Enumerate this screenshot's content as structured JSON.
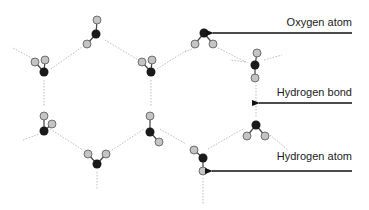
{
  "colors": {
    "oxygen": "#1a1a1a",
    "hydrogen": "#c4c4c4",
    "hydrogen_stroke": "#555555",
    "covalent_bond": "#444444",
    "hydrogen_bond": "#bdbdbd",
    "arrow": "#111111"
  },
  "labels": [
    {
      "id": "oxygen-atom",
      "text": "Oxygen atom",
      "x": 352,
      "y": 27,
      "arrow_from": [
        352,
        33
      ],
      "arrow_to": [
        213,
        33
      ]
    },
    {
      "id": "hydrogen-bond",
      "text": "Hydrogen bond",
      "x": 352,
      "y": 96,
      "arrow_from": [
        352,
        103
      ],
      "arrow_to": [
        259,
        103
      ]
    },
    {
      "id": "hydrogen-atom",
      "text": "Hydrogen atom",
      "x": 352,
      "y": 159,
      "arrow_from": [
        352,
        171
      ],
      "arrow_to": [
        212,
        171
      ]
    }
  ],
  "molecules": [
    {
      "o": [
        96,
        34
      ],
      "h": [
        [
          97,
          20
        ],
        [
          87,
          44
        ]
      ]
    },
    {
      "o": [
        44,
        72
      ],
      "h": [
        [
          35,
          62
        ],
        [
          45,
          60
        ]
      ]
    },
    {
      "o": [
        151,
        72
      ],
      "h": [
        [
          142,
          62
        ],
        [
          152,
          60
        ]
      ]
    },
    {
      "o": [
        204,
        33
      ],
      "h": [
        [
          195,
          44
        ],
        [
          213,
          44
        ]
      ]
    },
    {
      "o": [
        255,
        65
      ],
      "h": [
        [
          257,
          53
        ],
        [
          255,
          78
        ]
      ]
    },
    {
      "o": [
        44,
        131
      ],
      "h": [
        [
          44,
          116
        ],
        [
          52,
          124
        ]
      ]
    },
    {
      "o": [
        150,
        132
      ],
      "h": [
        [
          150,
          116
        ],
        [
          159,
          142
        ]
      ]
    },
    {
      "o": [
        97,
        164
      ],
      "h": [
        [
          88,
          154
        ],
        [
          106,
          154
        ]
      ]
    },
    {
      "o": [
        256,
        125
      ],
      "h": [
        [
          247,
          136
        ],
        [
          265,
          136
        ]
      ]
    },
    {
      "o": [
        203,
        158
      ],
      "h": [
        [
          194,
          150
        ],
        [
          203,
          171
        ]
      ]
    }
  ],
  "hydrogen_bonds": [
    [
      [
        13,
        48
      ],
      [
        37,
        61
      ]
    ],
    [
      [
        51,
        69
      ],
      [
        82,
        47
      ]
    ],
    [
      [
        105,
        40
      ],
      [
        140,
        61
      ]
    ],
    [
      [
        157,
        69
      ],
      [
        187,
        50
      ]
    ],
    [
      [
        44,
        80
      ],
      [
        44,
        106
      ]
    ],
    [
      [
        151,
        80
      ],
      [
        151,
        106
      ]
    ],
    [
      [
        23,
        140
      ],
      [
        39,
        134
      ]
    ],
    [
      [
        50,
        129
      ],
      [
        83,
        150
      ]
    ],
    [
      [
        112,
        150
      ],
      [
        144,
        129
      ]
    ],
    [
      [
        160,
        129
      ],
      [
        186,
        144
      ]
    ],
    [
      [
        97,
        172
      ],
      [
        97,
        190
      ]
    ],
    [
      [
        203,
        178
      ],
      [
        203,
        204
      ]
    ],
    [
      [
        208,
        149
      ],
      [
        243,
        129
      ]
    ],
    [
      [
        270,
        135
      ],
      [
        288,
        150
      ]
    ],
    [
      [
        256,
        85
      ],
      [
        256,
        118
      ]
    ],
    [
      [
        264,
        60
      ],
      [
        282,
        55
      ]
    ],
    [
      [
        218,
        48
      ],
      [
        248,
        63
      ]
    ],
    [
      [
        245,
        62
      ],
      [
        230,
        60
      ]
    ],
    [
      [
        185,
        52
      ],
      [
        196,
        47
      ]
    ]
  ]
}
